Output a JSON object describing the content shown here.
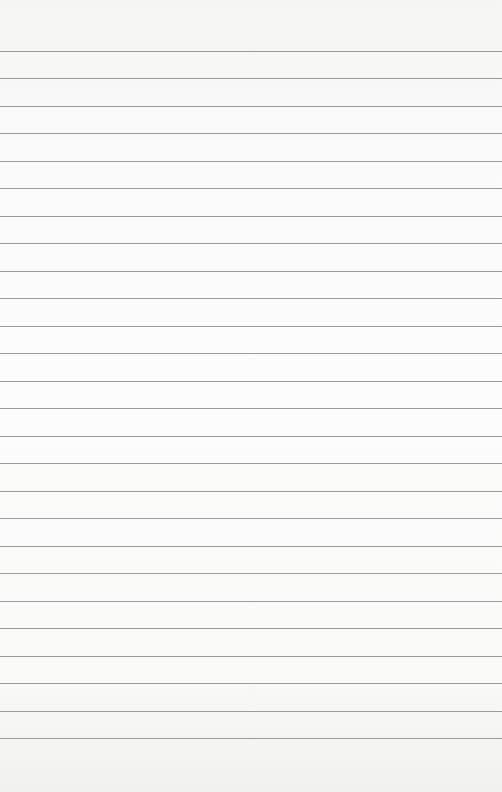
{
  "paper": {
    "type": "lined-paper",
    "background_color": "#fafafa",
    "line_color": "#9a9a9a",
    "first_line_y": 51,
    "line_spacing": 27.48,
    "line_count": 26
  }
}
